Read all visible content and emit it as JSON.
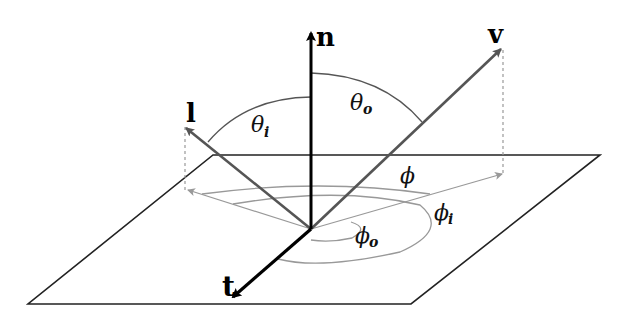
{
  "diagram": {
    "colors": {
      "background": "#ffffff",
      "plane": "#222222",
      "normal": "#000000",
      "tangent": "#000000",
      "vectors": "#555555",
      "arcs": "#999999",
      "projections": "#999999"
    },
    "vectors": {
      "normal": {
        "label": "n"
      },
      "light": {
        "label": "l"
      },
      "view": {
        "label": "v"
      },
      "tangent": {
        "label": "t"
      }
    },
    "angles": {
      "theta_i": {
        "symbol": "θ",
        "sub": "i"
      },
      "theta_o": {
        "symbol": "θ",
        "sub": "o"
      },
      "phi": {
        "symbol": "ϕ"
      },
      "phi_i": {
        "symbol": "ϕ",
        "sub": "i"
      },
      "phi_o": {
        "symbol": "ϕ",
        "sub": "o"
      }
    }
  }
}
